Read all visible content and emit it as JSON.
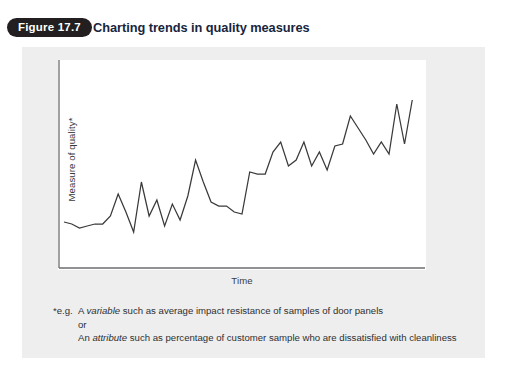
{
  "header": {
    "badge_label": "Figure 17.7",
    "title": "Charting trends in quality measures",
    "badge_bg": "#231f20",
    "badge_text_color": "#ffffff",
    "title_color": "#17253d"
  },
  "panel": {
    "background": "#eeeeef",
    "plot_background": "#ffffff",
    "axis_color": "#6b6b6d",
    "line_color": "#3a3a3c"
  },
  "footnote": {
    "marker": "*e.g.",
    "line1_prefix": "A ",
    "line1_italic": "variable",
    "line1_suffix": " such as average impact resistance of samples of door panels",
    "line2": "or",
    "line3_prefix": "An ",
    "line3_italic": "attribute",
    "line3_suffix": " such as percentage of customer sample who are dissatisfied with cleanliness"
  },
  "chart_data": {
    "type": "line",
    "title": "Charting trends in quality measures",
    "xlabel": "Time",
    "ylabel": "Measure of quality*",
    "grid": false,
    "legend": null,
    "axis_ticks": false,
    "xlim": [
      0,
      46
    ],
    "ylim": [
      0,
      100
    ],
    "annotation": "Upward trending zigzag series illustrating a quality measure improving over time",
    "x": [
      0,
      1,
      2,
      3,
      4,
      5,
      6,
      7,
      8,
      9,
      10,
      11,
      12,
      13,
      14,
      15,
      16,
      17,
      18,
      19,
      20,
      21,
      22,
      23,
      24,
      25,
      26,
      27,
      28,
      29,
      30,
      31,
      32,
      33,
      34,
      35,
      36,
      37,
      38,
      39,
      40,
      41,
      42,
      43,
      44,
      45
    ],
    "values": [
      21,
      20,
      18,
      19,
      20,
      20,
      24,
      35,
      26,
      16,
      41,
      24,
      32,
      19,
      30,
      22,
      34,
      52,
      41,
      31,
      29,
      29,
      26,
      25,
      46,
      45,
      45,
      56,
      61,
      49,
      52,
      61,
      49,
      56,
      47,
      59,
      60,
      74,
      68,
      62,
      55,
      61,
      55,
      80,
      60,
      82
    ]
  }
}
